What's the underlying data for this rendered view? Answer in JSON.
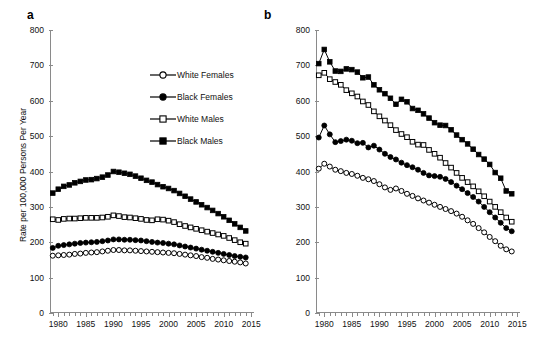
{
  "figure": {
    "ylabel": "Rate per 100,000 Persons Per Year",
    "panel_a_label": "a",
    "panel_b_label": "b"
  },
  "legend": {
    "position": "inside-panel-a-upper-right",
    "items": [
      {
        "label": "White Females",
        "marker": "open-circle-marker"
      },
      {
        "label": "Black Females",
        "marker": "filled-circle-marker"
      },
      {
        "label": "White Males",
        "marker": "open-square-marker"
      },
      {
        "label": "Black Males",
        "marker": "filled-square-marker"
      }
    ]
  },
  "chart_data": [
    {
      "type": "line",
      "panel": "a",
      "title": "a",
      "xlabel": "",
      "ylabel": "Rate per 100,000 Persons Per Year",
      "xlim": [
        1978.5,
        2015.5
      ],
      "ylim": [
        0,
        800
      ],
      "ytick_labels": [
        "0",
        "100",
        "200",
        "300",
        "400",
        "500",
        "600",
        "700",
        "800"
      ],
      "yticks": [
        0,
        100,
        200,
        300,
        400,
        500,
        600,
        700,
        800
      ],
      "xtick_labels": [
        "1980",
        "1985",
        "1990",
        "1995",
        "2000",
        "2005",
        "2010",
        "2015"
      ],
      "xticks": [
        1980,
        1985,
        1990,
        1995,
        2000,
        2005,
        2010,
        2015
      ],
      "minor_xticks_every": 1,
      "grid": false,
      "x": [
        1979,
        1980,
        1981,
        1982,
        1983,
        1984,
        1985,
        1986,
        1987,
        1988,
        1989,
        1990,
        1991,
        1992,
        1993,
        1994,
        1995,
        1996,
        1997,
        1998,
        1999,
        2000,
        2001,
        2002,
        2003,
        2004,
        2005,
        2006,
        2007,
        2008,
        2009,
        2010,
        2011,
        2012,
        2013,
        2014
      ],
      "series": [
        {
          "name": "White Females",
          "marker": "open-circle",
          "values": [
            162,
            163,
            164,
            165,
            167,
            168,
            170,
            171,
            172,
            174,
            176,
            178,
            178,
            177,
            177,
            176,
            175,
            174,
            173,
            172,
            171,
            170,
            169,
            167,
            165,
            163,
            161,
            158,
            156,
            153,
            151,
            149,
            147,
            145,
            143,
            140
          ]
        },
        {
          "name": "Black Females",
          "marker": "filled-circle",
          "values": [
            184,
            190,
            192,
            194,
            196,
            198,
            199,
            200,
            201,
            203,
            205,
            208,
            208,
            207,
            207,
            206,
            205,
            203,
            201,
            199,
            198,
            196,
            194,
            191,
            188,
            185,
            182,
            179,
            176,
            173,
            170,
            167,
            164,
            161,
            159,
            157
          ]
        },
        {
          "name": "White Males",
          "marker": "open-square",
          "values": [
            265,
            263,
            266,
            267,
            267,
            268,
            269,
            269,
            269,
            270,
            272,
            276,
            274,
            271,
            270,
            268,
            266,
            263,
            262,
            265,
            264,
            261,
            257,
            251,
            246,
            242,
            238,
            234,
            230,
            226,
            222,
            218,
            212,
            206,
            200,
            196
          ]
        },
        {
          "name": "Black Males",
          "marker": "filled-square",
          "values": [
            339,
            350,
            358,
            362,
            368,
            372,
            376,
            377,
            380,
            384,
            390,
            400,
            398,
            395,
            392,
            387,
            381,
            375,
            370,
            363,
            357,
            352,
            346,
            338,
            330,
            322,
            314,
            306,
            298,
            290,
            281,
            272,
            262,
            252,
            242,
            232
          ]
        }
      ]
    },
    {
      "type": "line",
      "panel": "b",
      "title": "b",
      "xlabel": "",
      "ylabel": "",
      "xlim": [
        1978.5,
        2015.5
      ],
      "ylim": [
        0,
        800
      ],
      "ytick_labels": [
        "0",
        "100",
        "200",
        "300",
        "400",
        "500",
        "600",
        "700",
        "800"
      ],
      "yticks": [
        0,
        100,
        200,
        300,
        400,
        500,
        600,
        700,
        800
      ],
      "xtick_labels": [
        "1980",
        "1985",
        "1990",
        "1995",
        "2000",
        "2005",
        "2010",
        "2015"
      ],
      "xticks": [
        1980,
        1985,
        1990,
        1995,
        2000,
        2005,
        2010,
        2015
      ],
      "minor_xticks_every": 1,
      "grid": false,
      "x": [
        1979,
        1980,
        1981,
        1982,
        1983,
        1984,
        1985,
        1986,
        1987,
        1988,
        1989,
        1990,
        1991,
        1992,
        1993,
        1994,
        1995,
        1996,
        1997,
        1998,
        1999,
        2000,
        2001,
        2002,
        2003,
        2004,
        2005,
        2006,
        2007,
        2008,
        2009,
        2010,
        2011,
        2012,
        2013,
        2014
      ],
      "series": [
        {
          "name": "White Females",
          "marker": "open-circle",
          "values": [
            408,
            422,
            414,
            405,
            401,
            396,
            393,
            388,
            382,
            378,
            373,
            364,
            355,
            348,
            352,
            345,
            337,
            331,
            324,
            318,
            312,
            306,
            300,
            294,
            288,
            281,
            272,
            262,
            252,
            240,
            228,
            215,
            203,
            190,
            180,
            174
          ]
        },
        {
          "name": "Black Females",
          "marker": "filled-circle",
          "values": [
            496,
            530,
            505,
            483,
            486,
            490,
            487,
            480,
            481,
            468,
            473,
            462,
            450,
            441,
            434,
            425,
            418,
            412,
            405,
            396,
            389,
            387,
            385,
            379,
            370,
            360,
            350,
            339,
            328,
            315,
            300,
            285,
            270,
            255,
            240,
            231
          ]
        },
        {
          "name": "White Males",
          "marker": "open-square",
          "values": [
            672,
            679,
            661,
            653,
            645,
            630,
            621,
            612,
            598,
            588,
            570,
            556,
            544,
            531,
            517,
            506,
            497,
            484,
            476,
            475,
            461,
            450,
            439,
            424,
            411,
            396,
            382,
            370,
            358,
            344,
            330,
            315,
            300,
            285,
            270,
            258
          ]
        },
        {
          "name": "Black Males",
          "marker": "filled-square",
          "values": [
            705,
            745,
            710,
            684,
            683,
            690,
            688,
            681,
            665,
            667,
            645,
            631,
            620,
            607,
            590,
            604,
            597,
            578,
            573,
            563,
            551,
            538,
            531,
            530,
            518,
            503,
            490,
            478,
            463,
            448,
            435,
            420,
            397,
            381,
            345,
            337
          ]
        }
      ]
    }
  ]
}
